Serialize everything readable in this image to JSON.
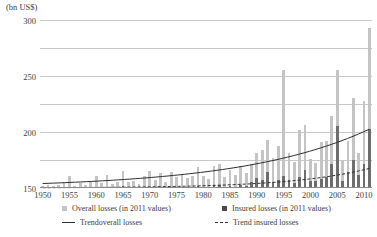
{
  "chart_data": {
    "type": "bar",
    "title": "",
    "xlabel": "",
    "ylabel": "(bn US$)",
    "unit_label": "(bn US$)",
    "ylim": [
      0,
      300
    ],
    "yticks": [
      50,
      100,
      150,
      200,
      250,
      300
    ],
    "xlim": [
      1950,
      2011
    ],
    "xticks": [
      1950,
      1955,
      1960,
      1965,
      1970,
      1975,
      1980,
      1985,
      1990,
      1995,
      2000,
      2005,
      2010
    ],
    "grid": true,
    "legend_position": "bottom",
    "categories": [
      1950,
      1951,
      1952,
      1953,
      1954,
      1955,
      1956,
      1957,
      1958,
      1959,
      1960,
      1961,
      1962,
      1963,
      1964,
      1965,
      1966,
      1967,
      1968,
      1969,
      1970,
      1971,
      1972,
      1973,
      1974,
      1975,
      1976,
      1977,
      1978,
      1979,
      1980,
      1981,
      1982,
      1983,
      1984,
      1985,
      1986,
      1987,
      1988,
      1989,
      1990,
      1991,
      1992,
      1993,
      1994,
      1995,
      1996,
      1997,
      1998,
      1999,
      2000,
      2001,
      2002,
      2003,
      2004,
      2005,
      2006,
      2007,
      2008,
      2009,
      2010,
      2011
    ],
    "series": [
      {
        "name": "Overall losses (in 2011 values)",
        "color": "#c4c4c4",
        "values": [
          4,
          6,
          3,
          5,
          10,
          22,
          4,
          9,
          5,
          12,
          22,
          9,
          24,
          8,
          10,
          30,
          10,
          13,
          7,
          22,
          30,
          14,
          27,
          10,
          28,
          20,
          23,
          17,
          22,
          38,
          22,
          16,
          40,
          43,
          20,
          32,
          23,
          40,
          26,
          43,
          62,
          68,
          85,
          54,
          75,
          210,
          62,
          46,
          103,
          113,
          52,
          44,
          82,
          84,
          128,
          210,
          50,
          84,
          160,
          62,
          155,
          285
        ]
      },
      {
        "name": "Insured losses (in 2011 values)",
        "color": "#6d6d6d",
        "values": [
          0.3,
          0.5,
          0.2,
          0.4,
          0.8,
          1.5,
          0.3,
          0.7,
          0.4,
          0.9,
          1.6,
          0.7,
          2.0,
          0.6,
          0.8,
          3.0,
          0.8,
          1.1,
          0.6,
          2.0,
          2.4,
          1.2,
          2.2,
          0.9,
          2.3,
          1.7,
          2.0,
          1.5,
          2.0,
          4.0,
          2.2,
          1.5,
          4.5,
          6.0,
          2.2,
          4.0,
          2.6,
          6.0,
          3.5,
          11.0,
          18.0,
          14.0,
          28.0,
          11.0,
          15.0,
          22.0,
          14.0,
          9.0,
          20.0,
          32.0,
          12.0,
          13.0,
          16.0,
          19.0,
          42.0,
          110.0,
          12.0,
          28.0,
          50.0,
          24.0,
          42.0,
          105.0
        ]
      }
    ],
    "trends": [
      {
        "name": "Trendoverall losses",
        "style": "solid",
        "color": "#2e2e2e",
        "start_value": 8,
        "end_value": 105
      },
      {
        "name": "Trend insured losses",
        "style": "dashed",
        "color": "#2e2e2e",
        "start_value": 0.5,
        "end_value": 35
      }
    ],
    "legend": [
      {
        "label": "Overall losses (in 2011 values)",
        "marker": "square",
        "color": "#c4c4c4"
      },
      {
        "label": "Insured losses (in 2011 values)",
        "marker": "square",
        "color": "#4a4a4a"
      },
      {
        "label": "Trendoverall losses",
        "marker": "line-solid",
        "color": "#2e2e2e"
      },
      {
        "label": "Trend insured losses",
        "marker": "line-dashed",
        "color": "#2e2e2e"
      }
    ]
  }
}
